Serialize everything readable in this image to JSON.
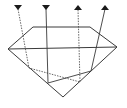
{
  "diagram": {
    "title": "",
    "type": "gem-light-path",
    "colors": {
      "line": "#3a3a3a",
      "dashed": "#555555",
      "arrow": "#1a1a1a",
      "background": "#ffffff"
    },
    "gem": {
      "table": {
        "x1": 33,
        "y1": 27,
        "x2": 90,
        "y2": 27
      },
      "girdle": {
        "left": [
          8,
          49
        ],
        "right": [
          117,
          47
        ]
      },
      "culet": [
        63,
        97
      ]
    },
    "rays": [
      {
        "id": "ray-1",
        "direction": "down",
        "style": "dashed",
        "x": 18,
        "top": 6
      },
      {
        "id": "ray-2",
        "direction": "down",
        "style": "solid",
        "x": 46,
        "top": 6
      },
      {
        "id": "ray-3",
        "direction": "up",
        "style": "dashed",
        "x": 78,
        "top": 6
      },
      {
        "id": "ray-4",
        "direction": "up",
        "style": "solid",
        "x": 105,
        "top": 6
      }
    ],
    "labels": []
  }
}
